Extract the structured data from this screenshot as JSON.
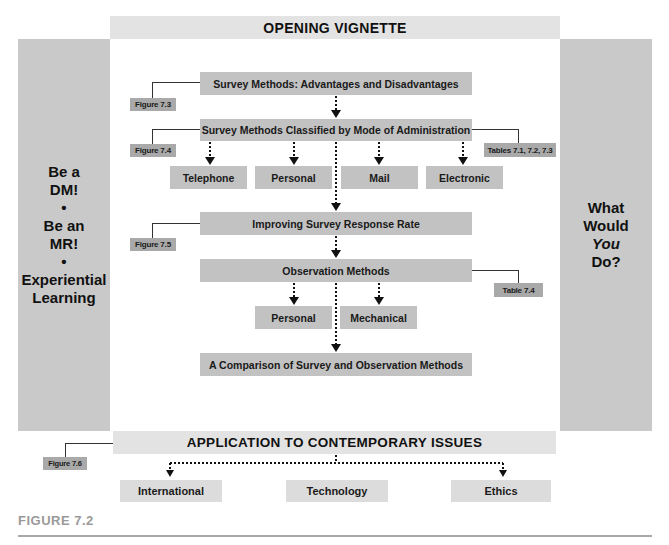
{
  "header": {
    "title": "OPENING VIGNETTE"
  },
  "left_panel": {
    "lines": [
      "Be a",
      "DM!",
      "•",
      "Be an",
      "MR!",
      "•",
      "Experiential",
      "Learning"
    ]
  },
  "right_panel": {
    "lines": [
      "What",
      "Would",
      "You",
      "Do?"
    ]
  },
  "flow": {
    "survey_advantages": "Survey Methods: Advantages and Disadvantages",
    "survey_classified": "Survey Methods Classified by Mode of Administration",
    "modes": [
      "Telephone",
      "Personal",
      "Mail",
      "Electronic"
    ],
    "improving_response": "Improving Survey Response Rate",
    "observation_methods": "Observation Methods",
    "observation_types": [
      "Personal",
      "Mechanical"
    ],
    "comparison": "A Comparison of Survey and Observation Methods"
  },
  "references": {
    "figure_7_3": "Figure 7.3",
    "figure_7_4": "Figure 7.4",
    "tables_7_1_7_2_7_3": "Tables 7.1, 7.2, 7.3",
    "figure_7_5": "Figure 7.5",
    "table_7_4": "Table 7.4",
    "figure_7_6": "Figure 7.6"
  },
  "application": {
    "title": "APPLICATION TO CONTEMPORARY ISSUES",
    "items": [
      "International",
      "Technology",
      "Ethics"
    ]
  },
  "caption": {
    "label": "FIGURE 7.2"
  },
  "colors": {
    "panel": "#c9c9c9",
    "box": "#c2c2c2",
    "tag": "#a9a9a9",
    "header_bar": "#e3e3e3",
    "caption": "#9a9a9a"
  }
}
